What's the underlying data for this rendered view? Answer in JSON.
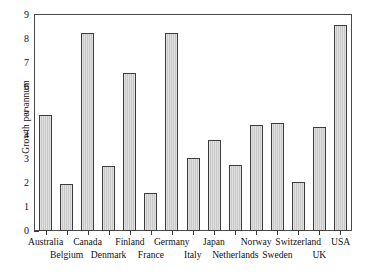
{
  "chart_data": {
    "type": "bar",
    "title": "",
    "xlabel": "",
    "ylabel": "Growth per annum",
    "ylim": [
      0,
      9
    ],
    "yticks": [
      "0",
      "1",
      "2",
      "3",
      "4",
      "5",
      "6",
      "7",
      "8",
      "9"
    ],
    "grid": false,
    "legend": "none",
    "categories": [
      "Australia",
      "Belgium",
      "Canada",
      "Denmark",
      "Finland",
      "France",
      "Germany",
      "Italy",
      "Japan",
      "Netherlands",
      "Norway",
      "Sweden",
      "Switzerland",
      "UK",
      "USA"
    ],
    "values": [
      4.85,
      1.95,
      8.25,
      2.7,
      6.6,
      1.6,
      8.25,
      3.05,
      3.8,
      2.75,
      4.4,
      4.5,
      2.05,
      4.35,
      8.6
    ],
    "bar_color": "#c8c8c8",
    "bar_edge_color": "#3c3c3c",
    "axis_color": "#4a4a4a",
    "label_rows": [
      "top",
      "bottom",
      "top",
      "bottom",
      "top",
      "bottom",
      "top",
      "bottom",
      "top",
      "bottom",
      "top",
      "bottom",
      "top",
      "bottom",
      "top"
    ]
  }
}
